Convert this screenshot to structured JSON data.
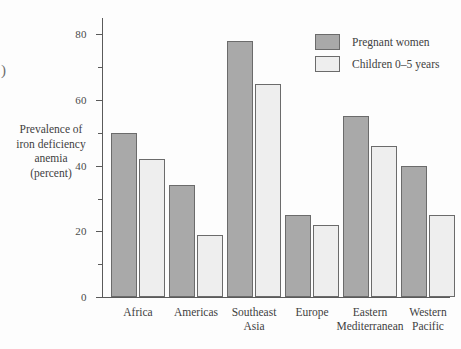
{
  "figure": {
    "edge_artifact_glyph": ")"
  },
  "chart_data": {
    "type": "bar",
    "title": "",
    "xlabel": "",
    "ylabel": "Prevalence of\niron deficiency\nanemia\n(percent)",
    "categories": [
      "Africa",
      "Americas",
      "Southeast\nAsia",
      "Europe",
      "Eastern\nMediterranean",
      "Western\nPacific"
    ],
    "series": [
      {
        "name": "Pregnant women",
        "color": "#a9a9a9",
        "values": [
          50,
          34,
          78,
          25,
          55,
          40
        ]
      },
      {
        "name": "Children 0–5 years",
        "color": "#eeeeee",
        "values": [
          42,
          19,
          65,
          22,
          46,
          25
        ]
      }
    ],
    "ylim": [
      0,
      85
    ],
    "y_major_ticks": [
      0,
      20,
      40,
      60,
      80
    ],
    "y_major_tick_labels": [
      "0",
      "20",
      "40",
      "60",
      "80"
    ],
    "y_minor_ticks": [
      10,
      30,
      50,
      70
    ],
    "grid": false,
    "legend_position": "top-right"
  },
  "legend": {
    "entries": [
      {
        "label": "Pregnant women",
        "swatch": "pregnant"
      },
      {
        "label": "Children 0–5 years",
        "swatch": "children"
      }
    ]
  }
}
